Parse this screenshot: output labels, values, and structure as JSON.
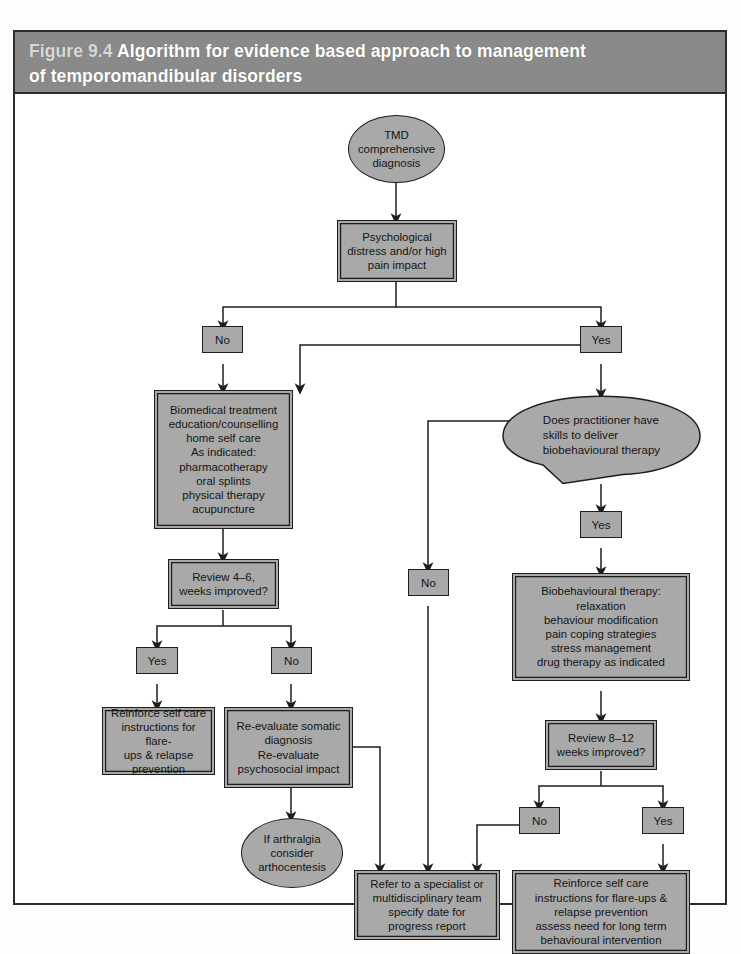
{
  "figure": {
    "number": "Figure 9.4",
    "title": "Algorithm for evidence based approach to management of temporomandibular disorders",
    "title_line1": "Algorithm for evidence based approach to management",
    "title_line2": "of temporomandibular disorders"
  },
  "colors": {
    "header_bar": "#8a8a8a",
    "node_fill": "#a9a9a9",
    "stroke": "#1d1d1d",
    "page": "#ffffff"
  },
  "nodes": {
    "start": {
      "shape": "ellipse",
      "lines": [
        "TMD",
        "comprehensive",
        "diagnosis"
      ]
    },
    "psych_screen": {
      "shape": "process",
      "lines": [
        "Psychological",
        "distress and/or high",
        "pain impact"
      ]
    },
    "biomedical": {
      "shape": "process",
      "lines": [
        "Biomedical treatment",
        "education/counselling",
        "home self care",
        "As indicated:",
        "pharmacotherapy",
        "oral splints",
        "physical therapy",
        "acupuncture"
      ]
    },
    "practitioner_skills": {
      "shape": "speech-bubble",
      "lines": [
        "Does practitioner have",
        "skills to deliver",
        "biobehavioural therapy"
      ]
    },
    "biobehavioural": {
      "shape": "process",
      "lines": [
        "Biobehavioural therapy:",
        "relaxation",
        "behaviour modification",
        "pain coping strategies",
        "stress management",
        "drug therapy as indicated"
      ]
    },
    "review_4_6": {
      "shape": "process",
      "lines": [
        "Review 4–6,",
        "weeks improved?"
      ]
    },
    "review_8_12": {
      "shape": "process",
      "lines": [
        "Review 8–12",
        "weeks improved?"
      ]
    },
    "reinforce_left": {
      "shape": "process",
      "lines": [
        "Reinforce self care",
        "instructions for flare-",
        "ups & relapse",
        "prevention"
      ]
    },
    "reevaluate": {
      "shape": "process",
      "lines": [
        "Re-evaluate somatic",
        "diagnosis",
        "Re-evaluate",
        "psychosocial impact"
      ]
    },
    "arthralgia": {
      "shape": "ellipse",
      "lines": [
        "If arthralgia",
        "consider",
        "arthocentesis"
      ]
    },
    "refer": {
      "shape": "process",
      "lines": [
        "Refer to a specialist or",
        "multidisciplinary team",
        "specify date for",
        "progress report"
      ]
    },
    "reinforce_right": {
      "shape": "process",
      "lines": [
        "Reinforce self care",
        "instructions for flare-ups &",
        "relapse prevention",
        "assess need for long term",
        "behavioural intervention"
      ]
    }
  },
  "labels": {
    "psych_no": "No",
    "psych_yes": "Yes",
    "skills_no": "No",
    "skills_yes": "Yes",
    "review46_yes": "Yes",
    "review46_no": "No",
    "review812_no": "No",
    "review812_yes": "Yes"
  }
}
